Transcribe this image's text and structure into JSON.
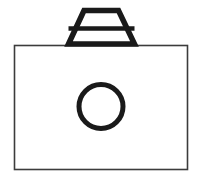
{
  "image": {
    "title": "Camera line-art icon",
    "subject": "camera",
    "style": "black outline line drawing on white background",
    "width": 200,
    "height": 184,
    "background_color": "#ffffff"
  },
  "palette": {
    "outline_dark": "#1a1a1a",
    "outline_thin": "#3c3c3c",
    "fill_white": "#ffffff"
  },
  "shapes": {
    "camera_body": {
      "name": "camera body",
      "type": "rectangle",
      "x": 14.5,
      "y": 45.5,
      "width": 173,
      "height": 124,
      "stroke": "#3c3c3c",
      "stroke_width": 1.6,
      "fill": "#ffffff"
    },
    "viewfinder": {
      "name": "viewfinder housing",
      "type": "trapezoid",
      "points": "68.5,44 84,10.5 118.5,10.5 134.5,44",
      "stroke": "#1a1a1a",
      "stroke_width": 5.5,
      "fill": "#ffffff"
    },
    "viewfinder_divider": {
      "name": "viewfinder divider line",
      "type": "line",
      "x1": 68.5,
      "y1": 28.5,
      "x2": 134.5,
      "y2": 28.5,
      "stroke": "#1a1a1a",
      "stroke_width": 4.5
    },
    "lens": {
      "name": "camera lens",
      "type": "circle",
      "cx": 101,
      "cy": 106.5,
      "r": 22,
      "stroke": "#1a1a1a",
      "stroke_width": 5,
      "fill": "#ffffff"
    }
  }
}
